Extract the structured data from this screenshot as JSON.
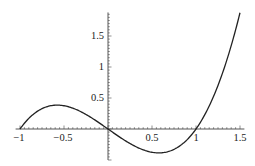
{
  "chart_data": {
    "type": "line",
    "title": "",
    "xlabel": "",
    "ylabel": "",
    "function": "x^3 - x",
    "xlim": [
      -1.05,
      1.55
    ],
    "ylim": [
      -0.5,
      1.88
    ],
    "grid": false,
    "legend": null,
    "x_ticks": [
      -1,
      -0.5,
      0.5,
      1,
      1.5
    ],
    "x_tick_labels": [
      "-1",
      "-0.5",
      "0.5",
      "1",
      "1.5"
    ],
    "y_ticks": [
      0.5,
      1,
      1.5
    ],
    "y_tick_labels": [
      "0.5",
      "1",
      "1.5"
    ],
    "series": [
      {
        "name": "f(x)",
        "color": "#222222",
        "x": [
          -1,
          -0.9,
          -0.8,
          -0.7,
          -0.577,
          -0.5,
          -0.4,
          -0.3,
          -0.2,
          -0.1,
          0,
          0.1,
          0.2,
          0.3,
          0.4,
          0.5,
          0.577,
          0.7,
          0.8,
          0.9,
          1,
          1.1,
          1.2,
          1.3,
          1.4,
          1.5
        ],
        "y": [
          0,
          0.171,
          0.288,
          0.357,
          0.385,
          0.375,
          0.336,
          0.273,
          0.192,
          0.099,
          0,
          -0.099,
          -0.192,
          -0.273,
          -0.336,
          -0.375,
          -0.385,
          -0.357,
          -0.288,
          -0.171,
          0,
          0.231,
          0.528,
          0.897,
          1.344,
          1.875
        ]
      }
    ]
  }
}
